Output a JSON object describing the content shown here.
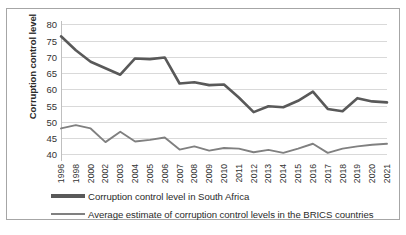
{
  "chart_data": {
    "type": "line",
    "title": "",
    "xlabel": "",
    "ylabel": "Corruption control level",
    "ylim": [
      38,
      81
    ],
    "yticks": [
      40,
      45,
      50,
      55,
      60,
      65,
      70,
      75,
      80
    ],
    "grid": true,
    "legend_position": "bottom-left",
    "categories": [
      "1996",
      "1998",
      "2000",
      "2002",
      "2003",
      "2004",
      "2005",
      "2006",
      "2007",
      "2008",
      "2009",
      "2010",
      "2011",
      "2012",
      "2013",
      "2014",
      "2015",
      "2016",
      "2017",
      "2018",
      "2019",
      "2020",
      "2021"
    ],
    "series": [
      {
        "name": "Corruption control level in South Africa",
        "color": "#595959",
        "values": [
          76.3,
          72.0,
          68.5,
          66.5,
          64.5,
          69.5,
          69.3,
          69.8,
          61.8,
          62.2,
          61.3,
          61.5,
          57.5,
          53.0,
          54.8,
          54.5,
          56.5,
          59.3,
          54.0,
          53.3,
          57.3,
          56.3,
          56.0
        ]
      },
      {
        "name": "Average estimate of corruption control levels in the BRICS countries",
        "color": "#808080",
        "values": [
          48.0,
          49.0,
          48.0,
          43.8,
          47.0,
          44.0,
          44.5,
          45.2,
          41.5,
          42.5,
          41.2,
          42.0,
          41.8,
          40.7,
          41.4,
          40.5,
          41.8,
          43.3,
          40.5,
          41.8,
          42.5,
          43.0,
          43.3
        ]
      }
    ]
  },
  "legend": {
    "items": [
      {
        "label": "Corruption control level in South Africa",
        "color": "#595959",
        "thickness": 3.2
      },
      {
        "label": "Average estimate of corruption control levels in the BRICS countries",
        "color": "#808080",
        "thickness": 2.4
      }
    ]
  }
}
